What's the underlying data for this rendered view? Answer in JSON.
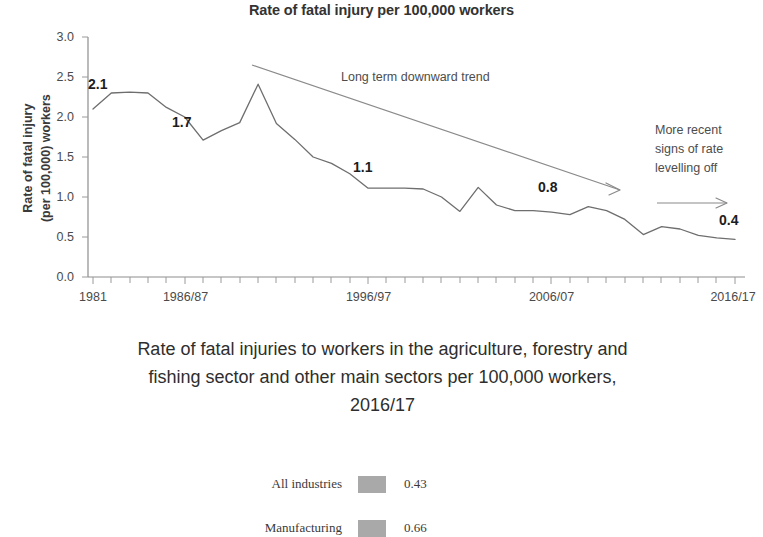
{
  "chart_data": {
    "type": "line",
    "title": "Rate of fatal injury per 100,000 workers",
    "xlabel": "",
    "ylabel": "Rate of fatal injury (per 100,000) workers",
    "ylabel_line1": "Rate of fatal injury",
    "ylabel_line2": "(per 100,000) workers",
    "ylim": [
      0.0,
      3.0
    ],
    "ytick_labels": [
      "0.0",
      "0.5",
      "1.0",
      "1.5",
      "2.0",
      "2.5",
      "3.0"
    ],
    "ytick_values": [
      0.0,
      0.5,
      1.0,
      1.5,
      2.0,
      2.5,
      3.0
    ],
    "xtick_labels": [
      "1981",
      "1986/87",
      "1996/97",
      "2006/07",
      "2016/17"
    ],
    "xtick_positions": [
      1981,
      1986,
      1996,
      2006,
      2016
    ],
    "grid": false,
    "legend_position": "none",
    "x": [
      1981,
      1982,
      1983,
      1984,
      1985,
      1986,
      1987,
      1988,
      1989,
      1990,
      1991,
      1992,
      1993,
      1994,
      1995,
      1996,
      1997,
      1998,
      1999,
      2000,
      2001,
      2002,
      2003,
      2004,
      2005,
      2006,
      2007,
      2008,
      2009,
      2010,
      2011,
      2012,
      2013,
      2014,
      2015,
      2016
    ],
    "values": [
      2.1,
      2.3,
      2.31,
      2.3,
      2.12,
      2.0,
      1.71,
      1.83,
      1.93,
      2.41,
      1.92,
      1.72,
      1.5,
      1.42,
      1.29,
      1.11,
      1.11,
      1.11,
      1.1,
      1.0,
      0.82,
      1.12,
      0.9,
      0.83,
      0.83,
      0.81,
      0.78,
      0.88,
      0.83,
      0.72,
      0.53,
      0.63,
      0.6,
      0.52,
      0.49,
      0.47
    ],
    "series": [
      {
        "name": "Agriculture, forestry and fishing",
        "values": [
          2.1,
          2.3,
          2.31,
          2.3,
          2.12,
          2.0,
          1.71,
          1.83,
          1.93,
          2.41,
          1.92,
          1.72,
          1.5,
          1.42,
          1.29,
          1.11,
          1.11,
          1.11,
          1.1,
          1.0,
          0.82,
          1.12,
          0.9,
          0.83,
          0.83,
          0.81,
          0.78,
          0.88,
          0.83,
          0.72,
          0.53,
          0.63,
          0.6,
          0.52,
          0.49,
          0.47
        ]
      }
    ],
    "data_labels": [
      {
        "text": "2.1",
        "x": 1981,
        "y": 2.1
      },
      {
        "text": "1.7",
        "x": 1987,
        "y": 1.71
      },
      {
        "text": "1.1",
        "x": 1996,
        "y": 1.11
      },
      {
        "text": "0.8",
        "x": 2006,
        "y": 0.81
      },
      {
        "text": "0.4",
        "x": 2016,
        "y": 0.47
      }
    ],
    "annotations": [
      {
        "text": "Long term downward trend",
        "type": "arrow-label"
      },
      {
        "text": "More recent",
        "type": "note-line1"
      },
      {
        "text": "signs of rate",
        "type": "note-line2"
      },
      {
        "text": "levelling off",
        "type": "note-line3"
      }
    ],
    "line_color": "#6e6e6e",
    "trend_color": "#8a8a8a"
  },
  "labels": {
    "p2_1": "2.1",
    "p1_7": "1.7",
    "p1_1": "1.1",
    "p0_8": "0.8",
    "p0_4": "0.4"
  },
  "annotations": {
    "trend": "Long term downward trend",
    "recent_1": "More recent",
    "recent_2": "signs of rate",
    "recent_3": "levelling off"
  },
  "yticks": {
    "t0": "0.0",
    "t1": "0.5",
    "t2": "1.0",
    "t3": "1.5",
    "t4": "2.0",
    "t5": "2.5",
    "t6": "3.0"
  },
  "xticks": {
    "t0": "1981",
    "t1": "1986/87",
    "t2": "1996/97",
    "t3": "2006/07",
    "t4": "2016/17"
  },
  "axis": {
    "y_title_line1": "Rate of fatal injury",
    "y_title_line2": "(per 100,000) workers"
  },
  "caption": {
    "line1": "Rate of fatal injuries to workers in the agriculture, forestry and",
    "line2": "fishing sector and other main sectors per 100,000 workers,",
    "line3": "2016/17"
  },
  "legend": {
    "rows": [
      {
        "label": "All industries",
        "value": "0.43",
        "color": "#a9a9a9"
      },
      {
        "label": "Manufacturing",
        "value": "0.66",
        "color": "#a9a9a9"
      }
    ]
  }
}
